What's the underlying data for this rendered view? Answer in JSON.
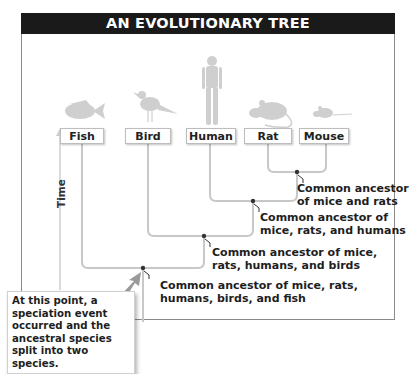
{
  "title": "AN EVOLUTIONARY TREE",
  "axis": {
    "label": "Time"
  },
  "species": [
    {
      "name": "Fish",
      "icon": "fish-icon"
    },
    {
      "name": "Bird",
      "icon": "bird-icon"
    },
    {
      "name": "Human",
      "icon": "human-icon"
    },
    {
      "name": "Rat",
      "icon": "rat-icon"
    },
    {
      "name": "Mouse",
      "icon": "mouse-icon"
    }
  ],
  "nodes": [
    {
      "line1": "Common ancestor",
      "line2": "of mice and rats"
    },
    {
      "line1": "Common ancestor of",
      "line2": "mice, rats, and humans"
    },
    {
      "line1": "Common ancestor of mice,",
      "line2": "rats, humans, and birds"
    },
    {
      "line1": "Common ancestor of mice, rats,",
      "line2": "humans, birds, and fish"
    }
  ],
  "callout": {
    "text": "At this point, a speciation event occurred and the ancestral species split into two species."
  },
  "colors": {
    "header_bg": "#1a1a1a",
    "branch": "#c8c8c8",
    "node_dot": "#333333",
    "silhouette": "#cfcfcf",
    "arrow": "#9a9a9a"
  }
}
